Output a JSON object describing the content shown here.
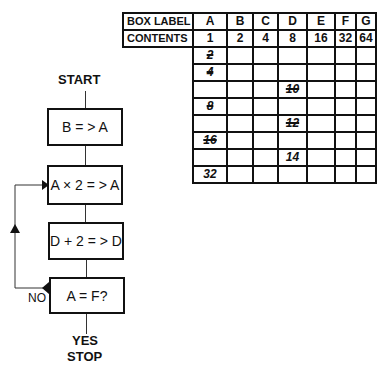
{
  "table": {
    "header_label": "BOX LABEL",
    "contents_label": "CONTENTS",
    "columns": [
      "A",
      "B",
      "C",
      "D",
      "E",
      "F",
      "G"
    ],
    "contents": [
      "1",
      "2",
      "4",
      "8",
      "16",
      "32",
      "64"
    ],
    "trace_rows": [
      {
        "A": "2",
        "A_struck": true
      },
      {
        "A": "4",
        "A_struck": true
      },
      {
        "D": "10",
        "D_struck": true
      },
      {
        "A": "8",
        "A_struck": true
      },
      {
        "D": "12",
        "D_struck": true
      },
      {
        "A": "16",
        "A_struck": true
      },
      {
        "D": "14",
        "D_struck": false
      },
      {
        "A": "32",
        "A_struck": false
      }
    ]
  },
  "flowchart": {
    "start": "START",
    "steps": [
      "B = > A",
      "A × 2 = > A",
      "D + 2 = > D",
      "A = F?"
    ],
    "no_label": "NO",
    "yes_label": "YES",
    "stop": "STOP"
  }
}
